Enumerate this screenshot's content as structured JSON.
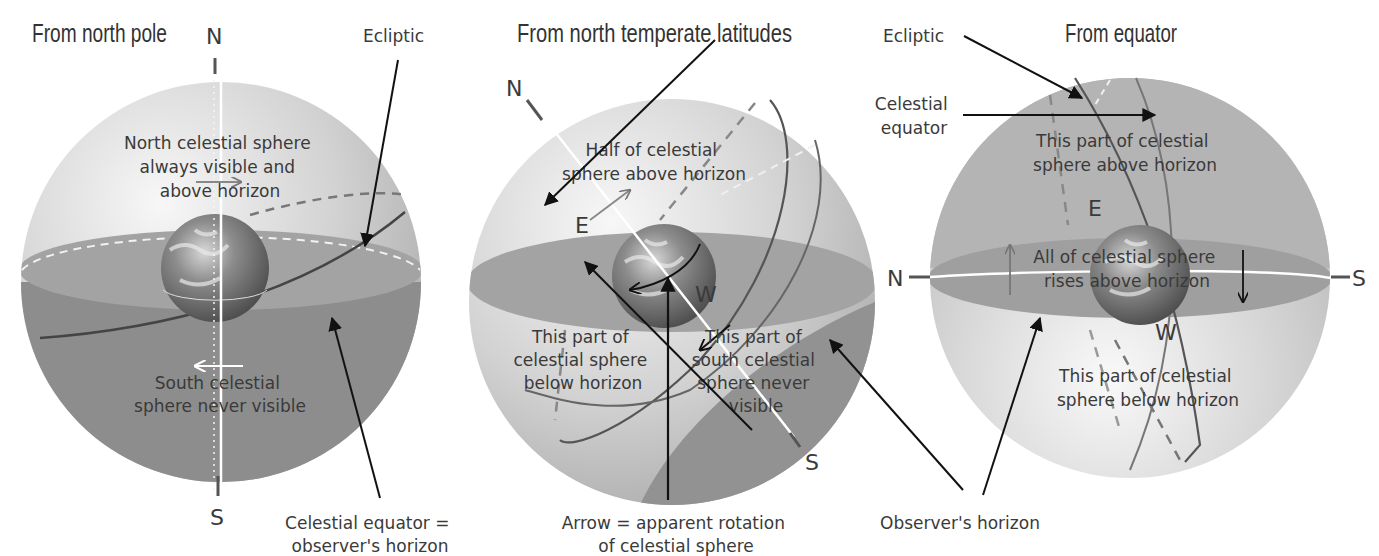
{
  "panels": [
    {
      "title": "From north pole",
      "pole_labels": {
        "north": "N",
        "south": "S"
      },
      "annotations": [
        "Ecliptic",
        "North celestial sphere always visible and above horizon",
        "South celestial sphere never visible",
        "Celestial equator = observer's horizon"
      ],
      "text": {
        "ecliptic": "Ecliptic",
        "north_line1": "North celestial sphere",
        "north_line2": "always visible and",
        "north_line3": "above horizon",
        "south_line1": "South celestial",
        "south_line2": "sphere never visible",
        "caption_line1": "Celestial equator =",
        "caption_line2": "observer's horizon"
      }
    },
    {
      "title": "From north temperate latitudes",
      "pole_labels": {
        "north": "N",
        "south": "S",
        "east": "E",
        "west": "W"
      },
      "text": {
        "half_line1": "Half of celestial",
        "half_line2": "sphere above horizon",
        "below_line1": "This part of",
        "below_line2": "celestial sphere",
        "below_line3": "below horizon",
        "never_line1": "This part of",
        "never_line2": "south celestial",
        "never_line3": "sphere never",
        "never_line4": "visible",
        "caption_line1": "Arrow = apparent rotation",
        "caption_line2": "of celestial sphere"
      }
    },
    {
      "title": "From equator",
      "pole_labels": {
        "north": "N",
        "south": "S",
        "east": "E",
        "west": "W"
      },
      "text": {
        "ecliptic": "Ecliptic",
        "equator_line1": "Celestial",
        "equator_line2": "equator",
        "above_line1": "This part of celestial",
        "above_line2": "sphere above horizon",
        "rises_line1": "All of celestial sphere",
        "rises_line2": "rises above horizon",
        "below_line1": "This part of celestial",
        "below_line2": "sphere below horizon",
        "caption": "Observer's horizon"
      }
    }
  ],
  "colors": {
    "sphere_light": "#e6e6e6",
    "sphere_mid": "#bdbdbd",
    "horizon_plane": "#9a9a9a",
    "lower_dark": "#8a8a8a",
    "arrow": "#111111",
    "circle_line": "#555555"
  }
}
